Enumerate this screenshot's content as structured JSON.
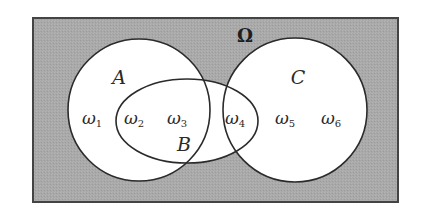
{
  "diagram": {
    "type": "venn",
    "universe": {
      "label": "Ω",
      "rect": {
        "x": 33,
        "y": 18,
        "width": 365,
        "height": 184
      },
      "fill": "#a9a9a9",
      "stroke": "#444444"
    },
    "sets": [
      {
        "id": "A",
        "label": "A",
        "shape": "circle",
        "cx": 139,
        "cy": 110,
        "r": 71,
        "label_pos": {
          "x": 119,
          "y": 84
        }
      },
      {
        "id": "B",
        "label": "B",
        "shape": "ellipse",
        "cx": 187,
        "cy": 121,
        "rx": 71,
        "ry": 42,
        "label_pos": {
          "x": 184,
          "y": 151
        }
      },
      {
        "id": "C",
        "label": "C",
        "shape": "circle",
        "cx": 295,
        "cy": 110,
        "r": 72,
        "label_pos": {
          "x": 298,
          "y": 84
        }
      }
    ],
    "elements": [
      {
        "id": "w1",
        "symbol": "ω",
        "subscript": "1",
        "x": 97,
        "y": 124,
        "in_sets": [
          "A"
        ]
      },
      {
        "id": "w2",
        "symbol": "ω",
        "subscript": "2",
        "x": 138,
        "y": 124,
        "in_sets": [
          "A",
          "B"
        ]
      },
      {
        "id": "w3",
        "symbol": "ω",
        "subscript": "3",
        "x": 181,
        "y": 124,
        "in_sets": [
          "A",
          "B"
        ]
      },
      {
        "id": "w4",
        "symbol": "ω",
        "subscript": "4",
        "x": 238,
        "y": 124,
        "in_sets": [
          "B",
          "C"
        ]
      },
      {
        "id": "w5",
        "symbol": "ω",
        "subscript": "5",
        "x": 288,
        "y": 124,
        "in_sets": [
          "C"
        ]
      },
      {
        "id": "w6",
        "symbol": "ω",
        "subscript": "6",
        "x": 334,
        "y": 124,
        "in_sets": [
          "C"
        ]
      }
    ],
    "colors": {
      "background_shade": "#a9a9a9",
      "set_fill": "#ffffff",
      "outline": "#2b2b2b"
    }
  }
}
